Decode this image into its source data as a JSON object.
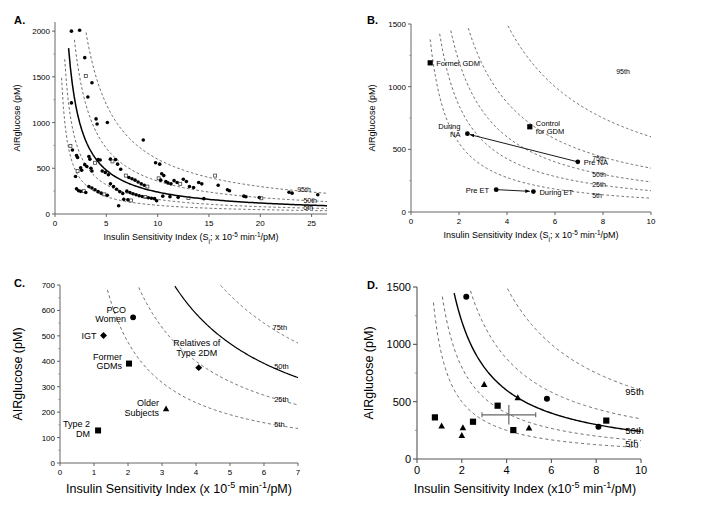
{
  "figure": {
    "panels": [
      "A.",
      "B.",
      "C.",
      "D."
    ]
  },
  "panelA": {
    "letter": "A.",
    "ylabel": "AIRglucose (pM)",
    "xlabel_pre": "Insulin Sensitivity Index (S",
    "xlabel_sub": "i",
    "xlabel_mid": "; x 10",
    "xlabel_sup1": "-5",
    "xlabel_mid2": " min",
    "xlabel_sup2": "-1",
    "xlabel_end": "/pM)",
    "yticks": [
      "0",
      "500",
      "1000",
      "1500",
      "2000"
    ],
    "xticks": [
      "0",
      "5",
      "10",
      "15",
      "20",
      "25"
    ],
    "percentiles": [
      "95th",
      "50th",
      "5th"
    ]
  },
  "panelB": {
    "letter": "B.",
    "ylabel": "AIRglucose (pM)",
    "xlabel_pre": "Insulin Sensitivity Index (S",
    "xlabel_sub": "i",
    "xlabel_mid": "; x 10",
    "xlabel_sup1": "-5",
    "xlabel_mid2": " min",
    "xlabel_sup2": "-1",
    "xlabel_end": "/pM)",
    "yticks": [
      "0",
      "500",
      "1000",
      "1500"
    ],
    "xticks": [
      "0",
      "2",
      "4",
      "6",
      "8",
      "10"
    ],
    "percentiles": [
      "95th",
      "75th",
      "50th",
      "25th",
      "5th"
    ],
    "point_labels": [
      "Former GDM",
      "Control",
      "for GDM",
      "During",
      "NA",
      "Pre NA",
      "Pre ET",
      "During ET"
    ]
  },
  "panelC": {
    "letter": "C.",
    "ylabel": "AIRglucose (pM)",
    "xlabel_pre": "Insulin Sensitivity Index (x 10",
    "xlabel_sup1": "-5",
    "xlabel_mid2": " min",
    "xlabel_sup2": "-1",
    "xlabel_end": "/pM)",
    "yticks": [
      "0",
      "100",
      "200",
      "300",
      "400",
      "500",
      "600",
      "700"
    ],
    "xticks": [
      "0",
      "1",
      "2",
      "3",
      "4",
      "5",
      "6",
      "7"
    ],
    "percentiles": [
      "75th",
      "50th",
      "25th",
      "5th"
    ],
    "point_labels": [
      "PCO",
      "Women",
      "IGT",
      "Former",
      "GDMs",
      "Relatives of",
      "Type 2DM",
      "Older",
      "Subjects",
      "Type 2",
      "DM"
    ]
  },
  "panelD": {
    "letter": "D.",
    "ylabel": "AIRglucose (pM)",
    "xlabel_pre": "Insulin Sensitivity Index (x10",
    "xlabel_sup1": "-5",
    "xlabel_mid2": " min",
    "xlabel_sup2": "-1",
    "xlabel_end": "/pM)",
    "yticks": [
      "0",
      "500",
      "1000",
      "1500"
    ],
    "xticks": [
      "0",
      "2",
      "4",
      "6",
      "8",
      "10"
    ],
    "percentiles": [
      "95th",
      "50th",
      "5th"
    ]
  },
  "chart_data": [
    {
      "id": "A",
      "type": "scatter",
      "title": "A.",
      "xlabel": "Insulin Sensitivity Index (Si; x 10-5 min-1/pM)",
      "ylabel": "AIRglucose (pM)",
      "xlim": [
        0,
        26.5
      ],
      "ylim": [
        0,
        2100
      ],
      "xticks": [
        0,
        5,
        10,
        15,
        20,
        25
      ],
      "yticks": [
        0,
        500,
        1000,
        1500,
        2000
      ],
      "grid": false,
      "legend": "none",
      "curves": [
        {
          "name": "95th",
          "style": "dashed",
          "k": 6000
        },
        {
          "name": "75th",
          "style": "dashed",
          "k": 3600
        },
        {
          "name": "50th",
          "style": "solid",
          "k": 2400
        },
        {
          "name": "25th",
          "style": "dashed",
          "k": 1600
        },
        {
          "name": "5th",
          "style": "dashed",
          "k": 950
        }
      ],
      "annotations": [
        "95th",
        "50th",
        "5th"
      ],
      "points": [
        [
          1.6,
          2000
        ],
        [
          2.4,
          2010
        ],
        [
          2.9,
          1710
        ],
        [
          3.0,
          1510
        ],
        [
          3.6,
          1435
        ],
        [
          1.6,
          1215
        ],
        [
          3.2,
          1280
        ],
        [
          4.0,
          1040
        ],
        [
          4.1,
          985
        ],
        [
          5.1,
          1000
        ],
        [
          1.5,
          745
        ],
        [
          1.7,
          700
        ],
        [
          2.1,
          640
        ],
        [
          2.2,
          618
        ],
        [
          3.3,
          628
        ],
        [
          3.4,
          600
        ],
        [
          2.0,
          410
        ],
        [
          2.2,
          470
        ],
        [
          2.5,
          505
        ],
        [
          2.6,
          478
        ],
        [
          2.9,
          540
        ],
        [
          3.1,
          520
        ],
        [
          3.5,
          500
        ],
        [
          3.6,
          470
        ],
        [
          3.9,
          560
        ],
        [
          4.2,
          595
        ],
        [
          4.4,
          590
        ],
        [
          4.6,
          470
        ],
        [
          4.9,
          455
        ],
        [
          5.2,
          430
        ],
        [
          5.4,
          600
        ],
        [
          5.6,
          575
        ],
        [
          5.9,
          595
        ],
        [
          6.1,
          545
        ],
        [
          6.4,
          490
        ],
        [
          2.1,
          275
        ],
        [
          2.3,
          255
        ],
        [
          2.5,
          248
        ],
        [
          2.8,
          250
        ],
        [
          3.0,
          235
        ],
        [
          3.3,
          300
        ],
        [
          3.6,
          285
        ],
        [
          3.9,
          265
        ],
        [
          4.2,
          245
        ],
        [
          4.5,
          228
        ],
        [
          4.8,
          215
        ],
        [
          5.1,
          205
        ],
        [
          5.4,
          330
        ],
        [
          5.7,
          300
        ],
        [
          6.0,
          270
        ],
        [
          6.3,
          245
        ],
        [
          6.6,
          225
        ],
        [
          6.9,
          420
        ],
        [
          7.2,
          400
        ],
        [
          7.5,
          385
        ],
        [
          7.8,
          370
        ],
        [
          8.1,
          350
        ],
        [
          8.4,
          330
        ],
        [
          8.7,
          315
        ],
        [
          9.0,
          300
        ],
        [
          7.0,
          250
        ],
        [
          7.3,
          235
        ],
        [
          7.6,
          222
        ],
        [
          7.9,
          210
        ],
        [
          8.2,
          200
        ],
        [
          8.5,
          192
        ],
        [
          8.8,
          185
        ],
        [
          9.1,
          178
        ],
        [
          9.4,
          172
        ],
        [
          9.7,
          168
        ],
        [
          6.2,
          90
        ],
        [
          6.7,
          160
        ],
        [
          7.1,
          155
        ],
        [
          7.4,
          148
        ],
        [
          9.9,
          145
        ],
        [
          8.6,
          810
        ],
        [
          9.8,
          560
        ],
        [
          10.2,
          545
        ],
        [
          10.4,
          440
        ],
        [
          10.6,
          420
        ],
        [
          10.1,
          390
        ],
        [
          10.3,
          370
        ],
        [
          10.8,
          355
        ],
        [
          11.0,
          340
        ],
        [
          11.3,
          330
        ],
        [
          11.6,
          365
        ],
        [
          11.9,
          345
        ],
        [
          12.2,
          330
        ],
        [
          12.5,
          380
        ],
        [
          12.8,
          355
        ],
        [
          13.1,
          300
        ],
        [
          13.5,
          290
        ],
        [
          14.0,
          345
        ],
        [
          14.3,
          330
        ],
        [
          15.6,
          420
        ],
        [
          15.9,
          315
        ],
        [
          16.8,
          265
        ],
        [
          17.0,
          255
        ],
        [
          18.4,
          195
        ],
        [
          18.6,
          188
        ],
        [
          19.9,
          180
        ],
        [
          20.1,
          172
        ],
        [
          22.8,
          238
        ],
        [
          23.1,
          228
        ],
        [
          25.6,
          210
        ],
        [
          10.5,
          195
        ],
        [
          11.2,
          190
        ],
        [
          12.0,
          182
        ],
        [
          13.0,
          175
        ],
        [
          14.5,
          168
        ]
      ]
    },
    {
      "id": "B",
      "type": "scatter",
      "title": "B.",
      "xlabel": "Insulin Sensitivity Index (Si; x 10-5 min-1/pM)",
      "ylabel": "AIRglucose (pM)",
      "xlim": [
        0,
        10
      ],
      "ylim": [
        0,
        1500
      ],
      "xticks": [
        0,
        2,
        4,
        6,
        8,
        10
      ],
      "yticks": [
        0,
        500,
        1000,
        1500
      ],
      "grid": false,
      "curves": [
        {
          "name": "95th",
          "style": "dashed",
          "k": 6000
        },
        {
          "name": "75th",
          "style": "dashed",
          "k": 3500
        },
        {
          "name": "50th",
          "style": "dashed",
          "k": 2400
        },
        {
          "name": "25th",
          "style": "dashed",
          "k": 1700
        },
        {
          "name": "5th",
          "style": "dashed",
          "k": 1100
        }
      ],
      "annotations": [
        "95th",
        "75th",
        "50th",
        "25th",
        "5th"
      ],
      "points": [
        {
          "label": "Former GDM",
          "marker": "square",
          "x": 0.8,
          "y": 1190,
          "label_pos": "right"
        },
        {
          "label": "Control for GDM",
          "marker": "square",
          "x": 4.95,
          "y": 680,
          "label_pos": "right"
        },
        {
          "label": "During NA",
          "marker": "circle",
          "x": 2.35,
          "y": 625,
          "label_pos": "left"
        },
        {
          "label": "Pre NA",
          "marker": "circle",
          "x": 6.95,
          "y": 400,
          "label_pos": "right"
        },
        {
          "label": "Pre ET",
          "marker": "circle",
          "x": 3.55,
          "y": 178,
          "label_pos": "left"
        },
        {
          "label": "During ET",
          "marker": "circle",
          "x": 5.1,
          "y": 163,
          "label_pos": "right"
        }
      ],
      "arrows": [
        {
          "from": [
            6.95,
            400
          ],
          "to": [
            2.45,
            618
          ],
          "note": "Pre NA to During NA"
        },
        {
          "from": [
            3.6,
            178
          ],
          "to": [
            4.95,
            165
          ],
          "note": "Pre ET to During ET"
        }
      ]
    },
    {
      "id": "C",
      "type": "scatter",
      "title": "C.",
      "xlabel": "Insulin Sensitivity Index (x 10-5 min-1/pM)",
      "ylabel": "AIRglucose (pM)",
      "xlim": [
        0,
        7
      ],
      "ylim": [
        0,
        700
      ],
      "xticks": [
        0,
        1,
        2,
        3,
        4,
        5,
        6,
        7
      ],
      "yticks": [
        0,
        100,
        200,
        300,
        400,
        500,
        600,
        700
      ],
      "grid": false,
      "curves": [
        {
          "name": "75th",
          "style": "dashed",
          "k": 3300
        },
        {
          "name": "50th",
          "style": "solid",
          "k": 2350
        },
        {
          "name": "25th",
          "style": "dashed",
          "k": 1600
        },
        {
          "name": "5th",
          "style": "dashed",
          "k": 950
        }
      ],
      "annotations": [
        "75th",
        "50th",
        "25th",
        "5th"
      ],
      "points": [
        {
          "label": "PCO Women",
          "marker": "circle",
          "x": 2.15,
          "y": 573,
          "label_pos": "left"
        },
        {
          "label": "IGT",
          "marker": "diamond",
          "x": 1.28,
          "y": 501,
          "label_pos": "left"
        },
        {
          "label": "Former GDMs",
          "marker": "square",
          "x": 2.03,
          "y": 391,
          "label_pos": "left"
        },
        {
          "label": "Relatives of Type 2DM",
          "marker": "diamond",
          "x": 4.08,
          "y": 375,
          "label_pos": "above"
        },
        {
          "label": "Older Subjects",
          "marker": "triangle",
          "x": 3.12,
          "y": 213,
          "label_pos": "left"
        },
        {
          "label": "Type 2 DM",
          "marker": "square",
          "x": 1.12,
          "y": 128,
          "label_pos": "left"
        }
      ]
    },
    {
      "id": "D",
      "type": "scatter",
      "title": "D.",
      "xlabel": "Insulin Sensitivity Index (x10-5 min-1/pM)",
      "ylabel": "AIRglucose (pM)",
      "xlim": [
        0,
        10
      ],
      "ylim": [
        0,
        1500
      ],
      "xticks": [
        0,
        2,
        4,
        6,
        8,
        10
      ],
      "yticks": [
        0,
        500,
        1000,
        1500
      ],
      "grid": false,
      "curves": [
        {
          "name": "95th",
          "style": "dashed",
          "k": 6000
        },
        {
          "name": "75th",
          "style": "dashed",
          "k": 3500
        },
        {
          "name": "50th",
          "style": "solid",
          "k": 2400
        },
        {
          "name": "25th",
          "style": "dashed",
          "k": 1600
        },
        {
          "name": "5th",
          "style": "dashed",
          "k": 1000
        }
      ],
      "annotations": [
        "95th",
        "50th",
        "5th"
      ],
      "points": [
        {
          "marker": "circle",
          "x": 2.2,
          "y": 1415
        },
        {
          "marker": "triangle",
          "x": 3.0,
          "y": 650
        },
        {
          "marker": "triangle",
          "x": 4.5,
          "y": 535
        },
        {
          "marker": "circle",
          "x": 5.8,
          "y": 525
        },
        {
          "marker": "square",
          "x": 3.6,
          "y": 465
        },
        {
          "marker": "square",
          "x": 0.8,
          "y": 363
        },
        {
          "marker": "square",
          "x": 8.45,
          "y": 335
        },
        {
          "marker": "square",
          "x": 2.5,
          "y": 325
        },
        {
          "marker": "triangle",
          "x": 1.1,
          "y": 288
        },
        {
          "marker": "circle",
          "x": 8.1,
          "y": 282
        },
        {
          "marker": "triangle",
          "x": 5.0,
          "y": 270
        },
        {
          "marker": "triangle",
          "x": 2.05,
          "y": 272
        },
        {
          "marker": "square",
          "x": 4.3,
          "y": 252
        },
        {
          "marker": "triangle",
          "x": 2.0,
          "y": 205
        }
      ],
      "errorbar": {
        "x": 4.1,
        "y": 385,
        "xerr": 1.2,
        "yerr": 85
      }
    }
  ]
}
